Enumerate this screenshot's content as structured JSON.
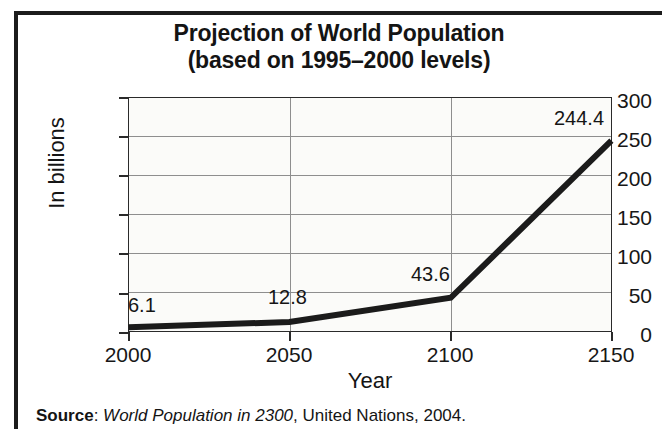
{
  "chart_data": {
    "type": "line",
    "title": "Projection of World Population (based on 1995–2000 levels)",
    "title_line1": "Projection of World Population",
    "title_line2": "(based on 1995–2000 levels)",
    "xlabel": "Year",
    "ylabel": "In billions",
    "x": [
      2000,
      2050,
      2100,
      2150
    ],
    "values": [
      6.1,
      12.8,
      43.6,
      244.4
    ],
    "point_labels": [
      "6.1",
      "12.8",
      "43.6",
      "244.4"
    ],
    "categories": [
      "2000",
      "2050",
      "2100",
      "2150"
    ],
    "xlim": [
      2000,
      2150
    ],
    "ylim": [
      0,
      300
    ],
    "ytick_labels": [
      "300",
      "250",
      "200",
      "150",
      "100",
      "50",
      "0"
    ],
    "ytick_values": [
      300,
      250,
      200,
      150,
      100,
      50,
      0
    ],
    "xtick_labels": [
      "2000",
      "2050",
      "2100",
      "2150"
    ],
    "xtick_values": [
      2000,
      2050,
      2100,
      2150
    ],
    "grid": "horizontal-and-vertical",
    "legend": "none",
    "series": [
      {
        "name": "Projected world population",
        "values": [
          6.1,
          12.8,
          43.6,
          244.4
        ]
      }
    ],
    "line_color": "#1b1b1b",
    "grid_color": "#8e8e8e",
    "axis_color": "#2a2a2a",
    "plot_background": "#fbfbf9"
  },
  "source": {
    "label": "Source",
    "separator": ": ",
    "publication": "World Population in 2300",
    "rest": ", United Nations, 2004."
  }
}
